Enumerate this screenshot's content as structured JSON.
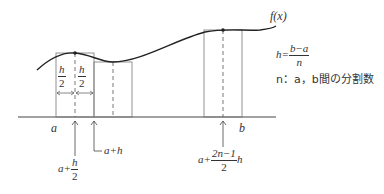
{
  "diagram": {
    "function_label": "f(x)",
    "axis": {
      "left_label": "a",
      "right_label": "b"
    },
    "half_width_labels": [
      {
        "num": "h",
        "den": "2"
      },
      {
        "num": "h",
        "den": "2"
      }
    ],
    "point_labels": {
      "first_midpoint": {
        "prefix": "a+",
        "num": "h",
        "den": "2"
      },
      "second_edge": "a+h",
      "last_midpoint": {
        "prefix": "a+",
        "num": "2n−1",
        "den": "2",
        "suffix": "h"
      }
    },
    "definitions": {
      "h_lhs": "h=",
      "h_num": "b−a",
      "h_den": "n",
      "n_def": "n：a，b間の分割数"
    },
    "colors": {
      "line": "#333333",
      "rect": "#777777",
      "background": "#ffffff"
    }
  }
}
